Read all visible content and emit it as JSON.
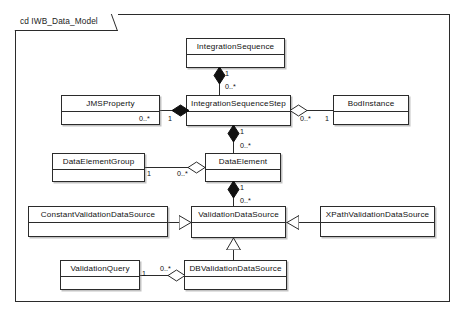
{
  "diagram": {
    "kind": "uml-class-diagram",
    "frame_label": "cd IWB_Data_Model",
    "stroke_color": "#2b2b2b",
    "fill_color": "#ffffff",
    "background": "#ffffff"
  },
  "classes": [
    {
      "id": "integration-sequence",
      "name": "IntegrationSequence"
    },
    {
      "id": "jms-property",
      "name": "JMSProperty"
    },
    {
      "id": "integration-sequence-step",
      "name": "IntegrationSequenceStep"
    },
    {
      "id": "bod-instance",
      "name": "BodInstance"
    },
    {
      "id": "data-element-group",
      "name": "DataElementGroup"
    },
    {
      "id": "data-element",
      "name": "DataElement"
    },
    {
      "id": "constant-validation-data-source",
      "name": "ConstantValidationDataSource"
    },
    {
      "id": "validation-data-source",
      "name": "ValidationDataSource"
    },
    {
      "id": "xpath-validation-data-source",
      "name": "XPathValidationDataSource"
    },
    {
      "id": "validation-query",
      "name": "ValidationQuery"
    },
    {
      "id": "db-validation-data-source",
      "name": "DBValidationDataSource"
    }
  ],
  "relationships": [
    {
      "id": "rel-seq-step",
      "type": "composition",
      "from": "IntegrationSequence",
      "to": "IntegrationSequenceStep",
      "from_mult": "1",
      "to_mult": "0..*"
    },
    {
      "id": "rel-step-jms",
      "type": "composition",
      "from": "IntegrationSequenceStep",
      "to": "JMSProperty",
      "from_mult": "1",
      "to_mult": "0..*"
    },
    {
      "id": "rel-step-bod",
      "type": "aggregation",
      "from": "IntegrationSequenceStep",
      "to": "BodInstance",
      "from_mult": "0..*",
      "to_mult": "1"
    },
    {
      "id": "rel-step-de",
      "type": "composition",
      "from": "IntegrationSequenceStep",
      "to": "DataElement",
      "from_mult": "1",
      "to_mult": "0..*"
    },
    {
      "id": "rel-deg-de",
      "type": "aggregation",
      "from": "DataElement",
      "to": "DataElementGroup",
      "from_mult": "0..*",
      "to_mult": "1"
    },
    {
      "id": "rel-de-vds",
      "type": "composition",
      "from": "DataElement",
      "to": "ValidationDataSource",
      "from_mult": "1",
      "to_mult": "0..*"
    },
    {
      "id": "rel-const-vds",
      "type": "generalization",
      "from": "ConstantValidationDataSource",
      "to": "ValidationDataSource",
      "from_mult": "",
      "to_mult": ""
    },
    {
      "id": "rel-xpath-vds",
      "type": "generalization",
      "from": "XPathValidationDataSource",
      "to": "ValidationDataSource",
      "from_mult": "",
      "to_mult": ""
    },
    {
      "id": "rel-db-vds",
      "type": "generalization",
      "from": "DBValidationDataSource",
      "to": "ValidationDataSource",
      "from_mult": "",
      "to_mult": ""
    },
    {
      "id": "rel-dbvds-vq",
      "type": "aggregation",
      "from": "DBValidationDataSource",
      "to": "ValidationQuery",
      "from_mult": "0..*",
      "to_mult": "1"
    }
  ],
  "multiplicity_labels": {
    "seq_to_step_near_seq": "1",
    "seq_to_step_near_step": "0..*",
    "step_to_jms_near_jms": "0..*",
    "step_to_jms_near_step": "1",
    "step_to_bod_near_step": "0..*",
    "step_to_bod_near_bod": "1",
    "step_to_de_near_step": "1",
    "step_to_de_near_de": "0..*",
    "deg_to_de_near_deg": "1",
    "deg_to_de_near_de": "0..*",
    "de_to_vds_near_de": "1",
    "de_to_vds_near_vds": "0..*",
    "vq_to_db_near_vq": "1",
    "vq_to_db_near_db": "0..*"
  }
}
